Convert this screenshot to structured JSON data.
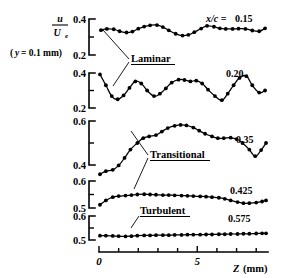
{
  "figure": {
    "background": "#ffffff",
    "ink": "#000000",
    "y_axis_label_numerator": "u",
    "y_axis_label_denominator": "U",
    "y_axis_label_denominator_sub": "e",
    "y_condition_label": "(y = 0.1 mm)",
    "y_condition_prefix": "(",
    "y_condition_var": "y",
    "y_condition_rest": " = 0.1 mm)",
    "x_axis_title_var": "Z",
    "x_axis_title_unit": "(mm)",
    "x_ticks": [
      0,
      1,
      2,
      3,
      4,
      5,
      6,
      7,
      8
    ],
    "x_tick_labels": [
      "0",
      "",
      "",
      "",
      "",
      "5",
      "",
      "",
      ""
    ],
    "x_min": 0,
    "x_max": 8.6,
    "regime_labels": [
      {
        "name": "Laminar",
        "text": "Laminar"
      },
      {
        "name": "Transitional",
        "text": "Transitional"
      },
      {
        "name": "Turbulent",
        "text": "Turbulent"
      }
    ]
  },
  "chart_data": {
    "type": "line",
    "title": "",
    "xlabel": "Z (mm)",
    "ylabel": "u/Ue  (y = 0.1 mm)",
    "xlim": [
      0,
      8.6
    ],
    "grid": false,
    "legend": "inline-right",
    "x_tick_values": [
      0,
      5
    ],
    "panels": [
      {
        "label": "x/c = 0.15",
        "label_prefix": "x/c = ",
        "label_value": "0.15",
        "regime": "Laminar",
        "ylim": [
          0.2,
          0.4
        ],
        "ytick_labels": [
          "0.2",
          "0.4"
        ],
        "yticks": [
          0.2,
          0.3,
          0.4
        ],
        "x": [
          0.1,
          0.4,
          0.75,
          1.05,
          1.4,
          1.7,
          2.0,
          2.3,
          2.6,
          2.95,
          3.25,
          3.55,
          3.9,
          4.25,
          4.55,
          4.85,
          5.2,
          5.5,
          5.85,
          6.15,
          6.45,
          6.8,
          7.1,
          7.45,
          7.8,
          8.15,
          8.45
        ],
        "values": [
          0.338,
          0.345,
          0.343,
          0.332,
          0.325,
          0.33,
          0.346,
          0.358,
          0.365,
          0.366,
          0.355,
          0.337,
          0.318,
          0.308,
          0.312,
          0.327,
          0.347,
          0.362,
          0.357,
          0.348,
          0.345,
          0.345,
          0.346,
          0.345,
          0.336,
          0.332,
          0.348,
          0.372
        ]
      },
      {
        "label": "0.20",
        "label_prefix": "",
        "label_value": "0.20",
        "regime": "Laminar",
        "ylim": [
          0.2,
          0.4
        ],
        "ytick_labels": [
          "0.2",
          "0.4"
        ],
        "yticks": [
          0.2,
          0.3,
          0.4
        ],
        "x": [
          0.05,
          0.35,
          0.65,
          0.95,
          1.25,
          1.55,
          1.85,
          2.15,
          2.45,
          2.8,
          3.1,
          3.4,
          3.7,
          4.05,
          4.35,
          4.65,
          4.95,
          5.25,
          5.55,
          5.9,
          6.25,
          6.55,
          6.85,
          7.15,
          7.5,
          7.8,
          8.15,
          8.45
        ],
        "values": [
          0.392,
          0.33,
          0.268,
          0.25,
          0.272,
          0.315,
          0.352,
          0.34,
          0.3,
          0.268,
          0.282,
          0.312,
          0.345,
          0.362,
          0.36,
          0.352,
          0.356,
          0.34,
          0.305,
          0.268,
          0.245,
          0.282,
          0.33,
          0.372,
          0.382,
          0.33,
          0.288,
          0.3
        ]
      },
      {
        "label": "0.35",
        "label_prefix": "",
        "label_value": "0.35",
        "regime": "Transitional",
        "ylim": [
          0.4,
          0.6
        ],
        "ytick_labels": [
          "0.4",
          "0.6"
        ],
        "yticks": [
          0.4,
          0.5,
          0.6
        ],
        "x": [
          0.05,
          0.35,
          0.7,
          1.0,
          1.3,
          1.6,
          1.95,
          2.25,
          2.55,
          2.9,
          3.2,
          3.5,
          3.85,
          4.15,
          4.45,
          4.8,
          5.1,
          5.4,
          5.75,
          6.05,
          6.35,
          6.7,
          7.0,
          7.3,
          7.65,
          7.95,
          8.25,
          8.5
        ],
        "values": [
          0.358,
          0.372,
          0.378,
          0.398,
          0.432,
          0.47,
          0.5,
          0.522,
          0.53,
          0.536,
          0.552,
          0.568,
          0.578,
          0.582,
          0.58,
          0.57,
          0.556,
          0.542,
          0.53,
          0.522,
          0.522,
          0.524,
          0.518,
          0.5,
          0.47,
          0.44,
          0.468,
          0.5
        ]
      },
      {
        "label": "0.425",
        "label_prefix": "",
        "label_value": "0.425",
        "regime": "Transitional",
        "ylim": [
          0.5,
          0.6
        ],
        "ytick_labels": [
          "0.5",
          "0.6"
        ],
        "yticks": [
          0.5,
          0.55,
          0.6
        ],
        "x": [
          0.05,
          0.35,
          0.7,
          1.0,
          1.35,
          1.65,
          1.95,
          2.3,
          2.6,
          2.9,
          3.25,
          3.55,
          3.85,
          4.2,
          4.5,
          4.8,
          5.15,
          5.45,
          5.75,
          6.1,
          6.4,
          6.7,
          7.05,
          7.35,
          7.65,
          8.0,
          8.3,
          8.5
        ],
        "values": [
          0.512,
          0.528,
          0.54,
          0.544,
          0.546,
          0.548,
          0.55,
          0.551,
          0.55,
          0.549,
          0.548,
          0.548,
          0.547,
          0.546,
          0.545,
          0.544,
          0.543,
          0.542,
          0.54,
          0.538,
          0.534,
          0.528,
          0.522,
          0.518,
          0.518,
          0.52,
          0.524,
          0.528
        ]
      },
      {
        "label": "0.575",
        "label_prefix": "",
        "label_value": "0.575",
        "regime": "Turbulent",
        "ylim": [
          0.5,
          0.6
        ],
        "ytick_labels": [
          "0.5",
          "0.6"
        ],
        "yticks": [
          0.5,
          0.55,
          0.6
        ],
        "x": [
          0.05,
          0.35,
          0.7,
          1.0,
          1.35,
          1.65,
          1.95,
          2.3,
          2.6,
          2.9,
          3.25,
          3.55,
          3.85,
          4.2,
          4.5,
          4.8,
          5.15,
          5.45,
          5.75,
          6.1,
          6.4,
          6.7,
          7.05,
          7.35,
          7.65,
          8.0,
          8.3,
          8.5
        ],
        "values": [
          0.518,
          0.518,
          0.517,
          0.516,
          0.515,
          0.516,
          0.518,
          0.519,
          0.519,
          0.52,
          0.52,
          0.52,
          0.521,
          0.521,
          0.522,
          0.522,
          0.522,
          0.523,
          0.523,
          0.524,
          0.524,
          0.525,
          0.525,
          0.526,
          0.526,
          0.527,
          0.528,
          0.528
        ]
      }
    ]
  }
}
